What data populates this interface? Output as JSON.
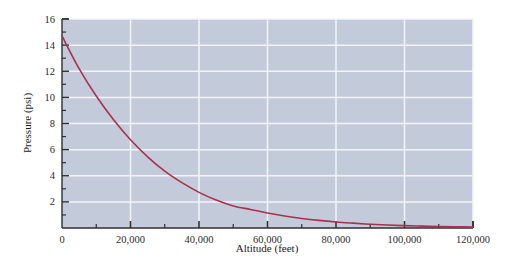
{
  "figure": {
    "background_color": "#ffffff",
    "plot_background_color": "#c3cbdb",
    "grid_color": "#f2f4f8",
    "axis_color": "#2f2f2f",
    "curve_color": "#a8314f"
  },
  "chart_data": {
    "type": "line",
    "title": "",
    "xlabel": "Altitude (feet)",
    "ylabel": "Pressure (psi)",
    "xlim": [
      0,
      120000
    ],
    "ylim": [
      0,
      16
    ],
    "grid": true,
    "legend": "none",
    "x_major_ticks": [
      0,
      20000,
      40000,
      60000,
      80000,
      100000,
      120000
    ],
    "x_tick_labels": [
      "0",
      "20,000",
      "40,000",
      "60,000",
      "80,000",
      "100,000",
      "120,000"
    ],
    "x_minor_ticks": [
      10000,
      30000,
      50000,
      70000,
      90000,
      110000
    ],
    "y_major_ticks": [
      2,
      4,
      6,
      8,
      10,
      12,
      14,
      16
    ],
    "y_tick_labels": [
      "2",
      "4",
      "6",
      "8",
      "10",
      "12",
      "14",
      "16"
    ],
    "y_minor_ticks": [
      1,
      3,
      5,
      7,
      9,
      11,
      13,
      15
    ],
    "series": [
      {
        "name": "Atmospheric pressure",
        "color": "#a8314f",
        "x": [
          0,
          5000,
          10000,
          15000,
          20000,
          25000,
          30000,
          35000,
          40000,
          45000,
          50000,
          55000,
          60000,
          65000,
          70000,
          75000,
          80000,
          85000,
          90000,
          95000,
          100000,
          105000,
          110000,
          115000,
          120000
        ],
        "y": [
          14.7,
          12.2,
          10.1,
          8.3,
          6.75,
          5.45,
          4.35,
          3.47,
          2.73,
          2.14,
          1.69,
          1.42,
          1.15,
          0.92,
          0.73,
          0.58,
          0.46,
          0.37,
          0.29,
          0.23,
          0.18,
          0.145,
          0.115,
          0.09,
          0.07
        ]
      }
    ]
  }
}
